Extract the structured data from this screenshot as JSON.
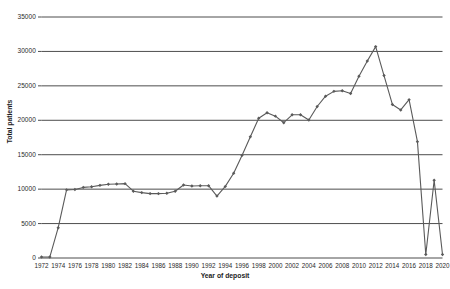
{
  "chart_data": {
    "type": "line",
    "title": "",
    "xlabel": "Year of deposit",
    "ylabel": "Total patients",
    "xlim": [
      1972,
      2020
    ],
    "ylim": [
      0,
      35000
    ],
    "grid": true,
    "legend": "none",
    "marker": "diamond",
    "line_color": "#5a5a5a",
    "marker_color": "#5a5a5a",
    "grid_color": "#4d4d4d",
    "ytick_labels": [
      "35000",
      "30000",
      "25000",
      "20000",
      "15000",
      "10000",
      "5000",
      "0"
    ],
    "ytick_values": [
      35000,
      30000,
      25000,
      20000,
      15000,
      10000,
      5000,
      0
    ],
    "xtick_labels": [
      "1972",
      "1974",
      "1976",
      "1978",
      "1980",
      "1982",
      "1984",
      "1986",
      "1988",
      "1990",
      "1992",
      "1994",
      "1996",
      "1998",
      "2000",
      "2002",
      "2004",
      "2006",
      "2008",
      "2010",
      "2012",
      "2014",
      "2016",
      "2018",
      "2020"
    ],
    "xtick_values": [
      1972,
      1974,
      1976,
      1978,
      1980,
      1982,
      1984,
      1986,
      1988,
      1990,
      1992,
      1994,
      1996,
      1998,
      2000,
      2002,
      2004,
      2006,
      2008,
      2010,
      2012,
      2014,
      2016,
      2018,
      2020
    ],
    "x": [
      1972,
      1973,
      1974,
      1975,
      1976,
      1977,
      1978,
      1979,
      1980,
      1981,
      1982,
      1983,
      1984,
      1985,
      1986,
      1987,
      1988,
      1989,
      1990,
      1991,
      1992,
      1993,
      1994,
      1995,
      1996,
      1997,
      1998,
      1999,
      2000,
      2001,
      2002,
      2003,
      2004,
      2005,
      2006,
      2007,
      2008,
      2009,
      2010,
      2011,
      2012,
      2013,
      2014,
      2015,
      2016,
      2017,
      2018,
      2019,
      2020
    ],
    "values": [
      150,
      150,
      4400,
      9900,
      9950,
      10250,
      10350,
      10550,
      10700,
      10750,
      10800,
      9700,
      9500,
      9350,
      9350,
      9400,
      9700,
      10600,
      10450,
      10500,
      10500,
      9000,
      10400,
      12300,
      14900,
      17600,
      20300,
      21100,
      20600,
      19650,
      20800,
      20800,
      20050,
      22000,
      23500,
      24200,
      24300,
      23900,
      26400,
      28600,
      30700,
      26500,
      22300,
      21500,
      23000,
      16900,
      500,
      11300,
      500
    ],
    "series_name": "Total patients"
  },
  "axes": {
    "y_title": "Total patients",
    "x_title": "Year of deposit"
  }
}
